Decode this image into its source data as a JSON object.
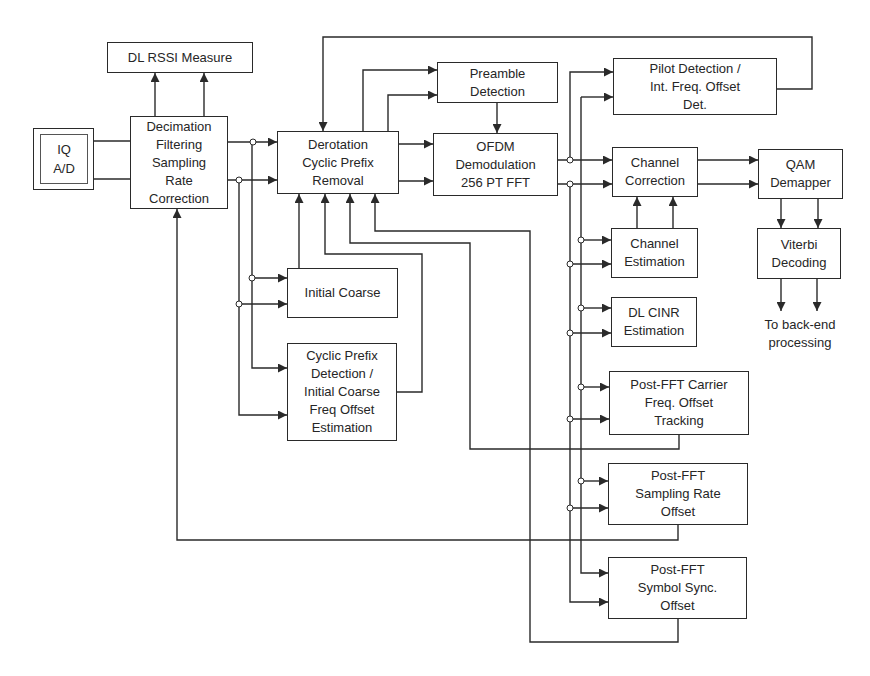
{
  "diagram": {
    "blocks": {
      "iq_ad": "IQ\nA/D",
      "rssi": "DL  RSSI Measure",
      "decimation": "Decimation\nFiltering\nSampling\nRate\nCorrection",
      "derotation": "Derotation\nCyclic    Prefix\nRemoval",
      "preamble": "Preamble\nDetection",
      "ofdm": "OFDM\nDemodulation\n256 PT FFT",
      "pilot": "Pilot      Detection /\nInt. Freq. Offset\nDet.",
      "channel_correction": "Channel\nCorrection",
      "qam": "QAM\nDemapper",
      "channel_estimation": "Channel\nEstimation",
      "viterbi": "Viterbi\nDecoding",
      "cinr": "DL    CINR\nEstimation",
      "initial_coarse": "Initial Coarse",
      "cyclic_prefix": "Cyclic    Prefix\nDetection /\nInitial Coarse\nFreq Offset\nEstimation",
      "carrier_tracking": "Post-FFT Carrier\nFreq. Offset\nTracking",
      "sampling_rate": "Post-FFT\nSampling Rate\nOffset",
      "symbol_sync": "Post-FFT\nSymbol Sync.\nOffset"
    },
    "output_note": "To back-end\nprocessing",
    "colors": {
      "line": "#2a2a2a",
      "text": "#262626",
      "background": "#ffffff"
    }
  }
}
